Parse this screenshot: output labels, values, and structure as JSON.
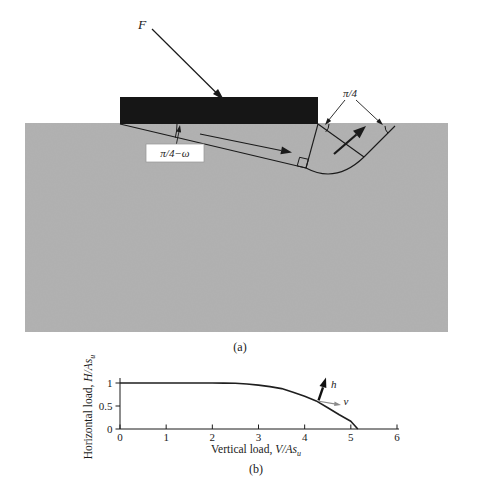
{
  "figure_captions": {
    "a": "(a)",
    "b": "(b)"
  },
  "panel_a": {
    "force_label": "F",
    "wedge_angle_label": "π/4−ω",
    "fan_angle_label": "π/4",
    "colors": {
      "soil_base": "#b0b0b0",
      "footing": "#161616",
      "line": "#1a1a1a"
    }
  },
  "chart_data": {
    "type": "line",
    "title": "",
    "xlabel": {
      "prefix": "Vertical load, ",
      "symbol": "V/As",
      "sub": "u"
    },
    "ylabel": {
      "prefix": "Horizontal load, ",
      "symbol": "H/As",
      "sub": "u"
    },
    "xlim": [
      0,
      6
    ],
    "ylim": [
      0,
      1
    ],
    "x_ticks": [
      0,
      1,
      2,
      3,
      4,
      5,
      6
    ],
    "x_tick_labels": [
      "0",
      "1",
      "2",
      "3",
      "4",
      "5",
      "6"
    ],
    "y_ticks": [
      0,
      0.5,
      1
    ],
    "y_tick_labels": [
      "0",
      "0.5",
      "1"
    ],
    "grid": false,
    "legend": "none",
    "series": [
      {
        "name": "failure envelope",
        "x": [
          0,
          0.5,
          1,
          1.5,
          2,
          2.25,
          2.5,
          2.75,
          3,
          3.25,
          3.5,
          3.75,
          4,
          4.25,
          4.5,
          4.75,
          5,
          5.15
        ],
        "y": [
          1,
          1,
          1,
          1,
          1,
          0.998,
          0.993,
          0.978,
          0.955,
          0.922,
          0.878,
          0.8,
          0.71,
          0.61,
          0.46,
          0.31,
          0.17,
          0
        ]
      }
    ],
    "annotations": {
      "velocity_arrow_origin": [
        4.3,
        0.62
      ],
      "h_label": "h",
      "v_label": "v"
    }
  }
}
